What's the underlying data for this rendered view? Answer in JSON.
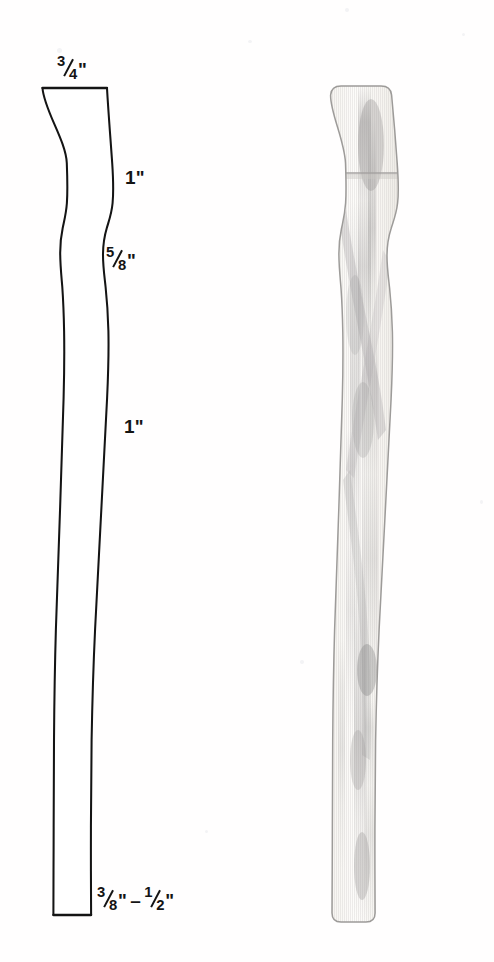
{
  "figure": {
    "background_color": "#ffffff",
    "outline_color": "#141414",
    "wood_color": "#f2efe9",
    "wood_shadow_color": "#9a9a9e"
  },
  "drawing": {
    "name": "leg-profile-outline",
    "description": "Two-dimensional side profile of a tapered table leg"
  },
  "photo": {
    "name": "turned-leg-photograph",
    "description": "Photograph of the finished light-colored turned wooden leg"
  },
  "labels": {
    "top": {
      "id": "label-top",
      "text": "3/4\"",
      "numerator": "3",
      "denominator": "4",
      "unit": "\""
    },
    "upper_width": {
      "id": "label-upper-1",
      "text": "1\"",
      "value": "1",
      "unit": "\""
    },
    "waist": {
      "id": "label-waist",
      "text": "5/8\"",
      "numerator": "5",
      "denominator": "8",
      "unit": "\""
    },
    "lower_width": {
      "id": "label-lower-1",
      "text": "1\"",
      "value": "1",
      "unit": "\""
    },
    "foot": {
      "id": "label-foot",
      "text": "3/8\" – 1/2\"",
      "from_numerator": "3",
      "from_denominator": "8",
      "dash": "–",
      "to_numerator": "1",
      "to_denominator": "2",
      "unit": "\""
    }
  }
}
